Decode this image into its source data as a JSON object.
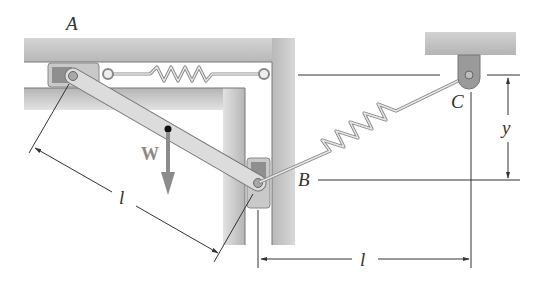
{
  "diagram": {
    "type": "mechanism-statics",
    "labels": {
      "point_a": "A",
      "point_b": "B",
      "point_c": "C",
      "weight": "W",
      "bar_length": "l",
      "horizontal_distance": "l",
      "vertical_distance": "y"
    },
    "colors": {
      "wall_fill": "#c8c8c8",
      "wall_dark": "#a9a9a9",
      "bar_fill": "#d9d9d9",
      "bar_edge": "#7a7a7a",
      "slider_fill": "#bdbdbd",
      "slider_inner": "#8c8c8c",
      "weight_arrow": "#8c8c8c",
      "dimension_line": "#333333"
    },
    "components": [
      {
        "id": "wall-frame",
        "description": "L-shaped guide frame with horizontal slot and vertical slot"
      },
      {
        "id": "slider-a",
        "description": "Collar sliding in horizontal slot at A"
      },
      {
        "id": "slider-b",
        "description": "Collar sliding in vertical slot at B"
      },
      {
        "id": "bar-ab",
        "description": "Uniform bar connecting A and B"
      },
      {
        "id": "spring-horizontal",
        "description": "Spring connecting slider A to right wall"
      },
      {
        "id": "spring-bc",
        "description": "Spring connecting B to fixed pin C"
      },
      {
        "id": "support-c",
        "description": "Ceiling bracket with pin C"
      }
    ]
  }
}
